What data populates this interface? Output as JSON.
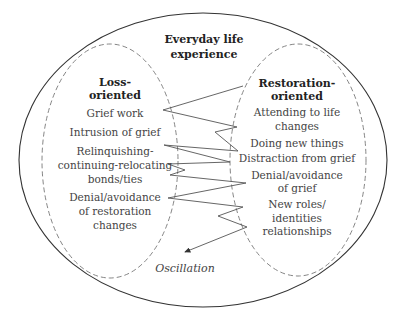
{
  "diagram": {
    "outer": {
      "title_lines": [
        "Everyday life",
        "experience"
      ]
    },
    "loss_oriented": {
      "title_lines": [
        "Loss-",
        "oriented"
      ],
      "items": [
        [
          "Grief work"
        ],
        [
          "Intrusion of grief"
        ],
        [
          "Relinquishing-",
          "continuing-relocating",
          "bonds/ties"
        ],
        [
          "Denial/avoidance",
          "of restoration",
          "changes"
        ]
      ]
    },
    "restoration_oriented": {
      "title_lines": [
        "Restoration-",
        "oriented"
      ],
      "items": [
        [
          "Attending to life",
          "changes"
        ],
        [
          "Doing new things"
        ],
        [
          "Distraction from grief"
        ],
        [
          "Denial/avoidance",
          "of grief"
        ],
        [
          "New roles/",
          "identities",
          "relationships"
        ]
      ]
    },
    "oscillation_label": "Oscillation",
    "colors": {
      "outer_stroke": "#333333",
      "dashed_stroke": "#777777",
      "zigzag_stroke": "#555555",
      "text": "#444444"
    }
  }
}
